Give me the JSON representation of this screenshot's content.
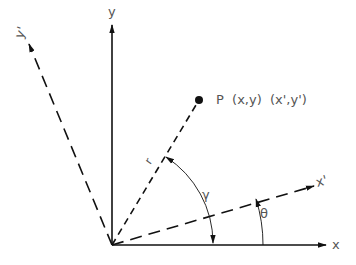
{
  "diagram": {
    "colors": {
      "line": "#111111",
      "label": "#555555",
      "background": "#ffffff"
    },
    "origin": {
      "x": 112,
      "y": 245
    },
    "axes": {
      "x": {
        "label": "x",
        "style": "solid"
      },
      "y": {
        "label": "y",
        "style": "solid"
      },
      "x_prime": {
        "label": "x'",
        "style": "dashed"
      },
      "y_prime": {
        "label": "y'",
        "style": "dashed"
      }
    },
    "radius_line": {
      "label": "r",
      "style": "dashed"
    },
    "point": {
      "label": "P  (x,y)  (x',y')",
      "name": "P"
    },
    "angles": {
      "gamma": {
        "symbol": "γ",
        "description": "angle from x-axis to r"
      },
      "theta": {
        "symbol": "θ",
        "description": "angle from x-axis to x'"
      }
    }
  }
}
